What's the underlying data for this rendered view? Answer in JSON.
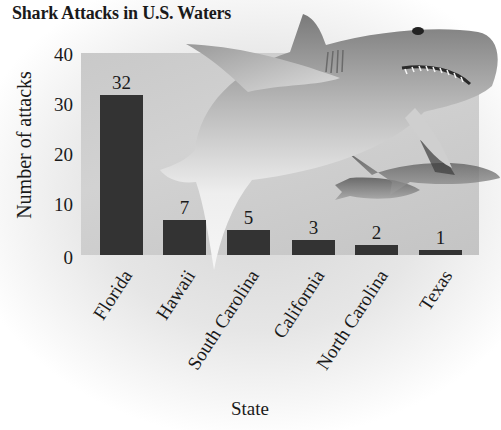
{
  "chart_data": {
    "type": "bar",
    "title": "Shark Attacks in U.S. Waters",
    "xlabel": "State",
    "ylabel": "Number of attacks",
    "categories": [
      "Florida",
      "Hawaii",
      "South Carolina",
      "California",
      "North Carolina",
      "Texas"
    ],
    "values": [
      32,
      7,
      5,
      3,
      2,
      1
    ],
    "ylim": [
      0,
      40
    ],
    "yticks": [
      "0",
      "10",
      "20",
      "30",
      "40"
    ],
    "data_labels": [
      "32",
      "7",
      "5",
      "3",
      "2",
      "1"
    ],
    "grid": false,
    "legend": null,
    "x_tick_rotation_deg": -57
  },
  "colors": {
    "bar": "#333333",
    "plot_background": "#cbcbcb",
    "text": "#1a1a1a"
  },
  "decoration": {
    "background_image": "shark-illustration"
  }
}
